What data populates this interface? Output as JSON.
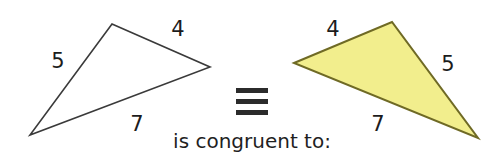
{
  "figure": {
    "caption": "is congruent to:",
    "congruence_symbol": "≡",
    "colors": {
      "outline_stroke": "#3a3a3a",
      "fill_yellow": "#f2ee8d",
      "yellow_stroke": "#6f6a25",
      "label_text": "#1c1c1c",
      "caption_text": "#1f1f1f",
      "background": "#ffffff"
    },
    "left_triangle": {
      "name": "unshaded triangle",
      "filled": false,
      "vertices": [
        {
          "id": "apex-top",
          "x": 112,
          "y": 24
        },
        {
          "id": "vertex-right",
          "x": 210,
          "y": 67
        },
        {
          "id": "vertex-bottom-left",
          "x": 30,
          "y": 135
        }
      ],
      "side_labels": [
        {
          "id": "left-side",
          "value": "5",
          "x": 58,
          "y": 62
        },
        {
          "id": "top-right-side",
          "value": "4",
          "x": 178,
          "y": 30
        },
        {
          "id": "bottom-side",
          "value": "7",
          "x": 137,
          "y": 125
        }
      ]
    },
    "right_triangle": {
      "name": "yellow shaded triangle",
      "filled": true,
      "vertices": [
        {
          "id": "vertex-left",
          "x": 294,
          "y": 63
        },
        {
          "id": "apex-top",
          "x": 392,
          "y": 22
        },
        {
          "id": "vertex-bottom-right",
          "x": 478,
          "y": 138
        }
      ],
      "side_labels": [
        {
          "id": "top-left-side",
          "value": "4",
          "x": 333,
          "y": 30
        },
        {
          "id": "right-side",
          "value": "5",
          "x": 448,
          "y": 65
        },
        {
          "id": "bottom-side",
          "value": "7",
          "x": 378,
          "y": 125
        }
      ]
    }
  }
}
